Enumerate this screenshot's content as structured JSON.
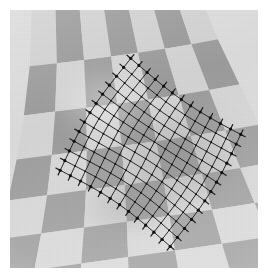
{
  "figure": {
    "caption": "",
    "domain_label": "computer-vision-figure",
    "canvas": {
      "width": 271,
      "height": 280,
      "background": "#ffffff"
    },
    "photo": {
      "name": "checkerboard-photograph",
      "left": 10,
      "top": 10,
      "width": 248,
      "height": 258,
      "grayscale": true,
      "border": "none"
    }
  },
  "colors": {
    "page_background": "#ffffff",
    "light_square": "#dddddd",
    "dark_square": "#a3a3a3",
    "light_square_far": "#d2d2d2",
    "dark_square_far": "#9a9a9a",
    "mesh_line": "#1d1d1d",
    "mesh_node": "#101010",
    "shadow": "#8e8e8e",
    "highlight": "#ececec"
  },
  "checkerboard": {
    "name": "checkerboard-cloth",
    "pattern": "checker",
    "columns": 7,
    "rows": 7,
    "projection": "perspective",
    "rotation_deg": -9,
    "note": "Squares enlarge toward the bottom of the frame due to perspective foreshortening."
  },
  "mesh": {
    "name": "deformable-mesh-overlay",
    "shape": "diamond",
    "columns": 12,
    "rows": 12,
    "line_color": "#1d1d1d",
    "line_width_px": 1,
    "node_color": "#101010",
    "node_radius_px": 1.6,
    "has_boundary_normals": true,
    "normal_length_px": 5,
    "center_x": 140,
    "center_y": 140,
    "half_width": 92,
    "half_height": 96,
    "orientation_deg": -12
  },
  "shadow": {
    "name": "cloth-shadow-crease",
    "center_x": 160,
    "center_y": 150,
    "radius_x": 72,
    "radius_y": 56,
    "opacity": 0.18
  },
  "chart_data": {
    "type": "scatter",
    "xlabel": "",
    "ylabel": "",
    "grid": true,
    "legend": "none",
    "series": [
      {
        "name": "mesh-nodes",
        "description": "Control points of the fitted quadrilateral mesh",
        "count_u": 13,
        "count_v": 13
      },
      {
        "name": "boundary-normals",
        "description": "Short outward tick marks at the mesh border nodes",
        "count": 48
      }
    ]
  }
}
